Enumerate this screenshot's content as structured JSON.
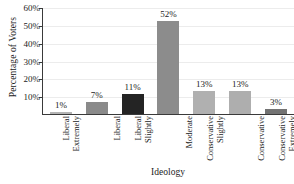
{
  "chart_data": {
    "type": "bar",
    "title": "",
    "xlabel": "Ideology",
    "ylabel": "Percentage of Voters",
    "categories": [
      "Extremely Liberal",
      "Liberal",
      "Slightly Liberal",
      "Moderate",
      "Slightly Conservative",
      "Conservative",
      "Extremely Conservative"
    ],
    "category_lines": [
      [
        "Extremely",
        "Liberal"
      ],
      [
        "Liberal"
      ],
      [
        "Slightly",
        "Liberal"
      ],
      [
        "Moderate"
      ],
      [
        "Slightly",
        "Conservative"
      ],
      [
        "Conservative"
      ],
      [
        "Extremely",
        "Conservative"
      ]
    ],
    "values": [
      1,
      7,
      11,
      52,
      13,
      13,
      3
    ],
    "value_labels": [
      "1%",
      "7%",
      "11%",
      "52%",
      "13%",
      "13%",
      "3%"
    ],
    "bar_colors": [
      "#b4b4b4",
      "#8a8a8a",
      "#242424",
      "#8c8c8c",
      "#b0b0b0",
      "#aeaeae",
      "#737373"
    ],
    "ylim": [
      0,
      60
    ],
    "ytick_values": [
      10,
      20,
      30,
      40,
      50,
      60
    ],
    "ytick_labels": [
      "10%",
      "20%",
      "30%",
      "40%",
      "50%",
      "60%"
    ],
    "grid": true,
    "legend": "none"
  },
  "axes": {
    "y_title": "Percentage of Voters",
    "x_title": "Ideology"
  }
}
